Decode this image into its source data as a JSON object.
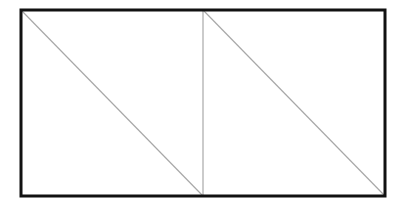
{
  "diagram": {
    "colors": {
      "background": "#ffffff",
      "outer_border": "#111111",
      "inner_lines": "#a8a8a8"
    },
    "outer_rect": {
      "x": 21,
      "y": 10,
      "width": 364,
      "height": 186,
      "stroke_width": 3
    },
    "lines": [
      {
        "name": "divider-vertical",
        "x1": 203,
        "y1": 10,
        "x2": 203,
        "y2": 196
      },
      {
        "name": "diagonal-left",
        "x1": 21,
        "y1": 10,
        "x2": 203,
        "y2": 196
      },
      {
        "name": "diagonal-right",
        "x1": 203,
        "y1": 10,
        "x2": 385,
        "y2": 196
      }
    ]
  }
}
